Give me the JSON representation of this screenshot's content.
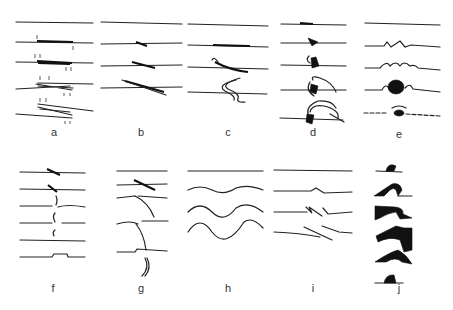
{
  "figure": {
    "panels": [
      {
        "id": "a",
        "label": "a",
        "description": "progressive overlapping thrust sheets"
      },
      {
        "id": "b",
        "label": "b",
        "description": "oblique shear lens development"
      },
      {
        "id": "c",
        "label": "c",
        "description": "recumbent fold/loop development"
      },
      {
        "id": "d",
        "label": "d",
        "description": "flame/fan structure development"
      },
      {
        "id": "e",
        "label": "e",
        "description": "boudin/nodule growth along layer"
      },
      {
        "id": "f",
        "label": "f",
        "description": "vertical disruption across layers"
      },
      {
        "id": "g",
        "label": "g",
        "description": "curved shear fracture propagation"
      },
      {
        "id": "h",
        "label": "h",
        "description": "sinusoidal buckle fold amplification"
      },
      {
        "id": "i",
        "label": "i",
        "description": "en echelon step offsets"
      },
      {
        "id": "j",
        "label": "j",
        "description": "dark overturned fold / flame structures"
      }
    ]
  }
}
